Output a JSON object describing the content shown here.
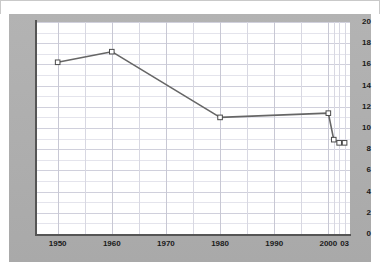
{
  "colors": {
    "frame": "#adadad",
    "plot_background": "#ffffff",
    "axis": "#555555",
    "line": "#666666",
    "marker_fill": "#ffffff",
    "marker_stroke": "#4a4a4a",
    "grid_minor": "#e4e4ec",
    "grid_major": "#d0d0dc",
    "tick_text": "#1a1a1a"
  },
  "chart_data": {
    "type": "line",
    "title": "",
    "subtitle": "",
    "xlabel": "",
    "ylabel": "",
    "xlim": [
      1946,
      2004
    ],
    "ylim": [
      0,
      20
    ],
    "grid": true,
    "legend": "none",
    "y_ticks": [
      "0",
      "2",
      "4",
      "6",
      "8",
      "10",
      "12",
      "14",
      "16",
      "18",
      "20"
    ],
    "y_tick_values": [
      0,
      2,
      4,
      6,
      8,
      10,
      12,
      14,
      16,
      18,
      20
    ],
    "x_ticks": [
      "1950",
      "1960",
      "1970",
      "1980",
      "1990",
      "2000",
      "03"
    ],
    "x_tick_values": [
      1950,
      1960,
      1970,
      1980,
      1990,
      2000,
      2003
    ],
    "marker": "open-square",
    "series": [
      {
        "name": "series-1",
        "x": [
          1950,
          1960,
          1980,
          2000,
          2001,
          2002,
          2003
        ],
        "values": [
          16.2,
          17.2,
          11.0,
          11.4,
          8.9,
          8.6,
          8.6
        ]
      }
    ]
  }
}
